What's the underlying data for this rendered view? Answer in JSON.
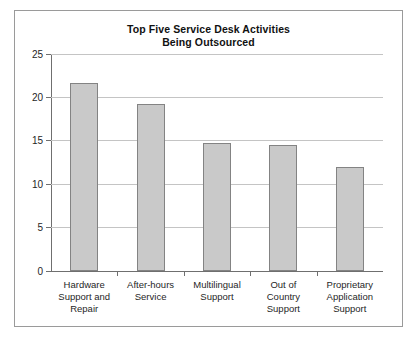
{
  "chart_data": {
    "type": "bar",
    "title": "Top Five Service Desk Activities Being Outsourced",
    "title_lines": [
      "Top Five Service Desk Activities",
      "Being Outsourced"
    ],
    "xlabel": "",
    "ylabel": "",
    "ylim": [
      0,
      25
    ],
    "yticks": [
      0,
      5,
      10,
      15,
      20,
      25
    ],
    "ytick_labels": [
      "0",
      "5",
      "10",
      "15",
      "20",
      "25"
    ],
    "grid": "horizontal",
    "legend": "none",
    "bar_fill_color": "#c9c9c9",
    "bar_border_color": "#838383",
    "categories": [
      "Hardware Support and Repair",
      "After-hours Service",
      "Multilingual Support",
      "Out of Country Support",
      "Proprietary Application Support"
    ],
    "category_label_lines": [
      [
        "Hardware",
        "Support and",
        "Repair"
      ],
      [
        "After-hours",
        "Service"
      ],
      [
        "Multilingual",
        "Support"
      ],
      [
        "Out of",
        "Country",
        "Support"
      ],
      [
        "Proprietary",
        "Application",
        "Support"
      ]
    ],
    "values": [
      21.6,
      19.2,
      14.7,
      14.5,
      12.0
    ]
  }
}
